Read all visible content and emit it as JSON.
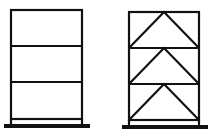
{
  "diagram": {
    "frames": [
      {
        "name": "unbraced-frame",
        "stories": 3,
        "bracing": "none"
      },
      {
        "name": "braced-frame",
        "stories": 3,
        "bracing": "chevron (inverted V)"
      }
    ],
    "colors": {
      "stroke": "#111111",
      "background": "#ffffff"
    }
  }
}
